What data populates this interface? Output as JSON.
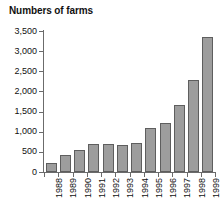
{
  "chart_data": {
    "type": "bar",
    "title": "Numbers of farms",
    "xlabel": "",
    "ylabel": "",
    "categories": [
      "1988",
      "1989",
      "1990",
      "1991",
      "1992",
      "1993",
      "1994",
      "1995",
      "1996",
      "1997",
      "1998",
      "1999"
    ],
    "values": [
      215,
      410,
      535,
      690,
      700,
      665,
      710,
      1090,
      1210,
      1665,
      2280,
      3350
    ],
    "ylim": [
      0,
      3500
    ],
    "ytick_values": [
      0,
      500,
      1000,
      1500,
      2000,
      2500,
      3000,
      3500
    ],
    "ytick_labels": [
      "0",
      "500",
      "1,000",
      "1,500",
      "2,000",
      "2,500",
      "3,000",
      "3,500"
    ],
    "grid": false,
    "legend": false,
    "bar_fill_color": "#9d9d9d",
    "bar_border_color": "#5e5e5e",
    "axis_color": "#6b6b6b",
    "background_color": "#ffffff"
  }
}
